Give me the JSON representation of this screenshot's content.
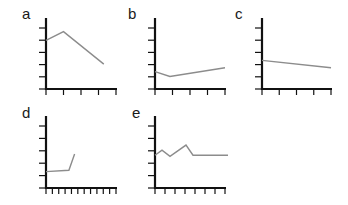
{
  "chart_data": [
    {
      "panel": "a",
      "type": "line",
      "title": "",
      "xlabel": "",
      "ylabel": "",
      "x": [
        0,
        1,
        3.3
      ],
      "values": [
        3.9,
        4.6,
        2.0
      ],
      "xlim": [
        0,
        4
      ],
      "ylim": [
        0,
        5.7
      ],
      "x_ticks": 5,
      "y_ticks": 6,
      "grid": false,
      "legend": null,
      "box": {
        "x0": 46,
        "y0": 89,
        "x1": 116,
        "y1": 18
      }
    },
    {
      "panel": "b",
      "type": "line",
      "title": "",
      "xlabel": "",
      "ylabel": "",
      "x": [
        0,
        0.85,
        4
      ],
      "values": [
        1.4,
        1.0,
        1.7
      ],
      "xlim": [
        0,
        4
      ],
      "ylim": [
        0,
        5.7
      ],
      "x_ticks": 5,
      "y_ticks": 6,
      "grid": false,
      "legend": null,
      "box": {
        "x0": 155,
        "y0": 89,
        "x1": 225,
        "y1": 18
      }
    },
    {
      "panel": "c",
      "type": "line",
      "title": "",
      "xlabel": "",
      "ylabel": "",
      "x": [
        0,
        4
      ],
      "values": [
        2.3,
        1.7
      ],
      "xlim": [
        0,
        4
      ],
      "ylim": [
        0,
        5.7
      ],
      "x_ticks": 5,
      "y_ticks": 6,
      "grid": false,
      "legend": null,
      "box": {
        "x0": 262,
        "y0": 89,
        "x1": 331,
        "y1": 18
      }
    },
    {
      "panel": "d",
      "type": "line",
      "title": "",
      "xlabel": "",
      "ylabel": "",
      "x": [
        0,
        3.6,
        4.5
      ],
      "values": [
        1.3,
        1.4,
        2.7
      ],
      "xlim": [
        0,
        11
      ],
      "ylim": [
        0,
        5.7
      ],
      "x_ticks": 12,
      "y_ticks": 6,
      "grid": false,
      "legend": null,
      "box": {
        "x0": 46,
        "y0": 188,
        "x1": 116,
        "y1": 116
      }
    },
    {
      "panel": "e",
      "type": "line",
      "title": "",
      "xlabel": "",
      "ylabel": "",
      "x": [
        0,
        0.7,
        1.5,
        3.1,
        3.8,
        7.3
      ],
      "values": [
        2.6,
        3.0,
        2.5,
        3.4,
        2.6,
        2.6
      ],
      "xlim": [
        0,
        7
      ],
      "ylim": [
        0,
        5.7
      ],
      "x_ticks": 8,
      "y_ticks": 6,
      "grid": false,
      "legend": null,
      "box": {
        "x0": 155,
        "y0": 188,
        "x1": 225,
        "y1": 116
      }
    }
  ],
  "panels": [
    {
      "label": "a",
      "label_x": 22,
      "label_y": 19
    },
    {
      "label": "b",
      "label_x": 128,
      "label_y": 19
    },
    {
      "label": "c",
      "label_x": 235,
      "label_y": 19
    },
    {
      "label": "d",
      "label_x": 22,
      "label_y": 118
    },
    {
      "label": "e",
      "label_x": 132,
      "label_y": 118
    }
  ],
  "colors": {
    "axis": "#111111",
    "series": "#8c8c8c",
    "label": "#1a1a1a"
  }
}
